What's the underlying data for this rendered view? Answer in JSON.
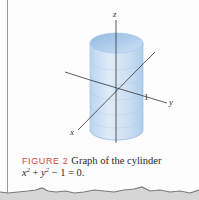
{
  "figure": {
    "type": "3d-surface-illustration",
    "surface": "cylinder",
    "axes": {
      "x_label": "x",
      "y_label": "y",
      "z_label": "z"
    },
    "tick_label": "1",
    "colors": {
      "cylinder_fill": "#c9def2",
      "cylinder_shade": "#9fc3e6",
      "axis": "#333333"
    }
  },
  "caption": {
    "figure_number": "FIGURE 2",
    "text": "Graph of the cylinder",
    "equation_parts": {
      "x": "x",
      "x_exp": "2",
      "plus": " + ",
      "y": "y",
      "y_exp": "2",
      "rest": " − 1 = 0."
    },
    "colors": {
      "figure_number": "#d24a3c",
      "text": "#2a2a2a"
    }
  }
}
